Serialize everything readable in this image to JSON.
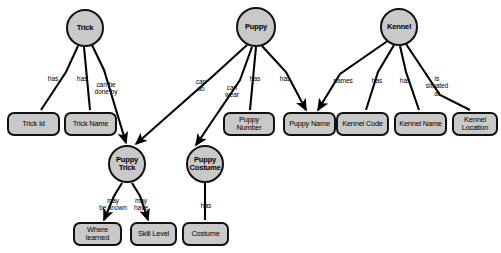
{
  "diagram": {
    "style": {
      "node_fill": "#c9c9c9",
      "node_stroke": "#111111",
      "edge_color": "#000000",
      "background": "#ffffff"
    },
    "entities": [
      {
        "id": "trick",
        "label": "Trick",
        "cx": 85,
        "cy": 28,
        "r": 19
      },
      {
        "id": "puppy",
        "label": "Puppy",
        "cx": 256,
        "cy": 27,
        "r": 20
      },
      {
        "id": "kennel",
        "label": "Kennel",
        "cx": 399,
        "cy": 27,
        "r": 19
      },
      {
        "id": "puppy_trick",
        "label": "Puppy\nTrick",
        "cx": 127,
        "cy": 164,
        "r": 19
      },
      {
        "id": "puppy_costume",
        "label": "Puppy\nCostume",
        "cx": 205,
        "cy": 164,
        "r": 19
      }
    ],
    "attributes": [
      {
        "id": "trick_id",
        "label": "Trick Id",
        "x": 7,
        "y": 112,
        "w": 53,
        "h": 24
      },
      {
        "id": "trick_name",
        "label": "Trick Name",
        "x": 64,
        "y": 112,
        "w": 53,
        "h": 24
      },
      {
        "id": "puppy_number",
        "label": "Puppy\nNumber",
        "x": 223,
        "y": 112,
        "w": 52,
        "h": 24
      },
      {
        "id": "puppy_name",
        "label": "Puppy Name",
        "x": 283,
        "y": 112,
        "w": 53,
        "h": 24
      },
      {
        "id": "kennel_code",
        "label": "Kennel Code",
        "x": 336,
        "y": 112,
        "w": 53,
        "h": 24
      },
      {
        "id": "kennel_name",
        "label": "Kennel Name",
        "x": 394,
        "y": 112,
        "w": 53,
        "h": 24
      },
      {
        "id": "kennel_location",
        "label": "Kennel\nLocation",
        "x": 452,
        "y": 112,
        "w": 46,
        "h": 24
      },
      {
        "id": "where_learned",
        "label": "Where\nlearned",
        "x": 73,
        "y": 222,
        "w": 49,
        "h": 24
      },
      {
        "id": "skill_level",
        "label": "Skill Level",
        "x": 130,
        "y": 222,
        "w": 47,
        "h": 24
      },
      {
        "id": "costume",
        "label": "Costume",
        "x": 182,
        "y": 222,
        "w": 47,
        "h": 24
      }
    ],
    "relationships": [
      {
        "id": "trick-has-trickid",
        "from": "trick",
        "to": "trick_id",
        "label": "has",
        "lx": 53,
        "ly": 79,
        "arrow": false
      },
      {
        "id": "trick-has-trickname",
        "from": "trick",
        "to": "trick_name",
        "label": "has",
        "lx": 82,
        "ly": 79,
        "arrow": false
      },
      {
        "id": "trick-canbedoneby",
        "from": "trick",
        "to": "puppy_trick",
        "label": "can be\ndone by",
        "lx": 106,
        "ly": 88,
        "arrow": true
      },
      {
        "id": "puppy-cando",
        "from": "puppy",
        "to": "puppy_trick",
        "label": "can\ndo",
        "lx": 201,
        "ly": 85,
        "arrow": true
      },
      {
        "id": "puppy-canwear",
        "from": "puppy",
        "to": "puppy_costume",
        "label": "can\nwear",
        "lx": 232,
        "ly": 91,
        "arrow": true
      },
      {
        "id": "puppy-has-number",
        "from": "puppy",
        "to": "puppy_number",
        "label": "has",
        "lx": 255,
        "ly": 79,
        "arrow": false
      },
      {
        "id": "puppy-has-name",
        "from": "puppy",
        "to": "puppy_name",
        "label": "has",
        "lx": 285,
        "ly": 79,
        "arrow": true
      },
      {
        "id": "kennel-names-puppyname",
        "from": "kennel",
        "to": "puppy_name",
        "label": "names",
        "lx": 343,
        "ly": 81,
        "arrow": true
      },
      {
        "id": "kennel-has-code",
        "from": "kennel",
        "to": "kennel_code",
        "label": "has",
        "lx": 377,
        "ly": 81,
        "arrow": false
      },
      {
        "id": "kennel-has-name",
        "from": "kennel",
        "to": "kennel_name",
        "label": "has",
        "lx": 405,
        "ly": 81,
        "arrow": false
      },
      {
        "id": "kennel-issituatedat",
        "from": "kennel",
        "to": "kennel_location",
        "label": "is\nsituated\nat",
        "lx": 437,
        "ly": 86,
        "arrow": false
      },
      {
        "id": "puppytrick-maybeknown",
        "from": "puppy_trick",
        "to": "where_learned",
        "label": "may\nbe known",
        "lx": 113,
        "ly": 204,
        "arrow": true
      },
      {
        "id": "puppytrick-mayhave",
        "from": "puppy_trick",
        "to": "skill_level",
        "label": "may\nhave",
        "lx": 141,
        "ly": 204,
        "arrow": true
      },
      {
        "id": "puppycostume-has-costume",
        "from": "puppy_costume",
        "to": "costume",
        "label": "has",
        "lx": 206,
        "ly": 206,
        "arrow": false
      }
    ],
    "edge_paths": [
      {
        "id": "trick-has-trickid",
        "x1": 78,
        "y1": 46,
        "x2": 41,
        "y2": 110,
        "bend": {
          "x": 66,
          "y": 72
        }
      },
      {
        "id": "trick-has-trickname",
        "x1": 84,
        "y1": 47,
        "x2": 90,
        "y2": 110,
        "bend": null
      },
      {
        "id": "trick-canbedoneby",
        "x1": 92,
        "y1": 45,
        "x2": 126,
        "y2": 143,
        "bend": {
          "x": 104,
          "y": 70
        }
      },
      {
        "id": "puppy-cando",
        "x1": 247,
        "y1": 45,
        "x2": 136,
        "y2": 144,
        "bend": {
          "x": 213,
          "y": 76
        }
      },
      {
        "id": "puppy-canwear",
        "x1": 252,
        "y1": 47,
        "x2": 196,
        "y2": 145,
        "bend": {
          "x": 240,
          "y": 80
        }
      },
      {
        "id": "puppy-has-number",
        "x1": 256,
        "y1": 47,
        "x2": 250,
        "y2": 110,
        "bend": null
      },
      {
        "id": "puppy-has-name",
        "x1": 262,
        "y1": 46,
        "x2": 306,
        "y2": 110,
        "bend": {
          "x": 286,
          "y": 72
        }
      },
      {
        "id": "kennel-names-puppyname",
        "x1": 389,
        "y1": 40,
        "x2": 318,
        "y2": 110,
        "bend": {
          "x": 340,
          "y": 74
        }
      },
      {
        "id": "kennel-has-code",
        "x1": 394,
        "y1": 45,
        "x2": 366,
        "y2": 110,
        "bend": {
          "x": 378,
          "y": 72
        }
      },
      {
        "id": "kennel-has-name",
        "x1": 400,
        "y1": 46,
        "x2": 419,
        "y2": 110,
        "bend": {
          "x": 406,
          "y": 72
        }
      },
      {
        "id": "kennel-issituatedat",
        "x1": 406,
        "y1": 44,
        "x2": 470,
        "y2": 110,
        "bend": {
          "x": 440,
          "y": 95
        }
      },
      {
        "id": "puppytrick-maybeknown",
        "x1": 122,
        "y1": 183,
        "x2": 104,
        "y2": 220,
        "bend": {
          "x": 114,
          "y": 196
        }
      },
      {
        "id": "puppytrick-mayhave",
        "x1": 132,
        "y1": 183,
        "x2": 148,
        "y2": 220,
        "bend": {
          "x": 140,
          "y": 196
        }
      },
      {
        "id": "puppycostume-has-costume",
        "x1": 205,
        "y1": 183,
        "x2": 205,
        "y2": 220,
        "bend": null
      }
    ]
  }
}
